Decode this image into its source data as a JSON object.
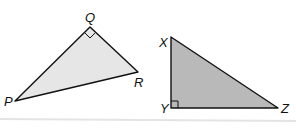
{
  "diagram": {
    "triangles": [
      {
        "name": "PQR",
        "fill": "#e6e6e6",
        "right_angle_at": "Q",
        "vertices": {
          "P": {
            "label": "P",
            "x": 15,
            "y": 101
          },
          "Q": {
            "label": "Q",
            "x": 90,
            "y": 27
          },
          "R": {
            "label": "R",
            "x": 138,
            "y": 72
          }
        }
      },
      {
        "name": "XYZ",
        "fill": "#b9b9b9",
        "right_angle_at": "Y",
        "vertices": {
          "X": {
            "label": "X",
            "x": 171,
            "y": 37
          },
          "Y": {
            "label": "Y",
            "x": 171,
            "y": 108
          },
          "Z": {
            "label": "Z",
            "x": 278,
            "y": 108
          }
        }
      }
    ],
    "stroke": "#111111",
    "divider_color": "#e4e4e4"
  }
}
